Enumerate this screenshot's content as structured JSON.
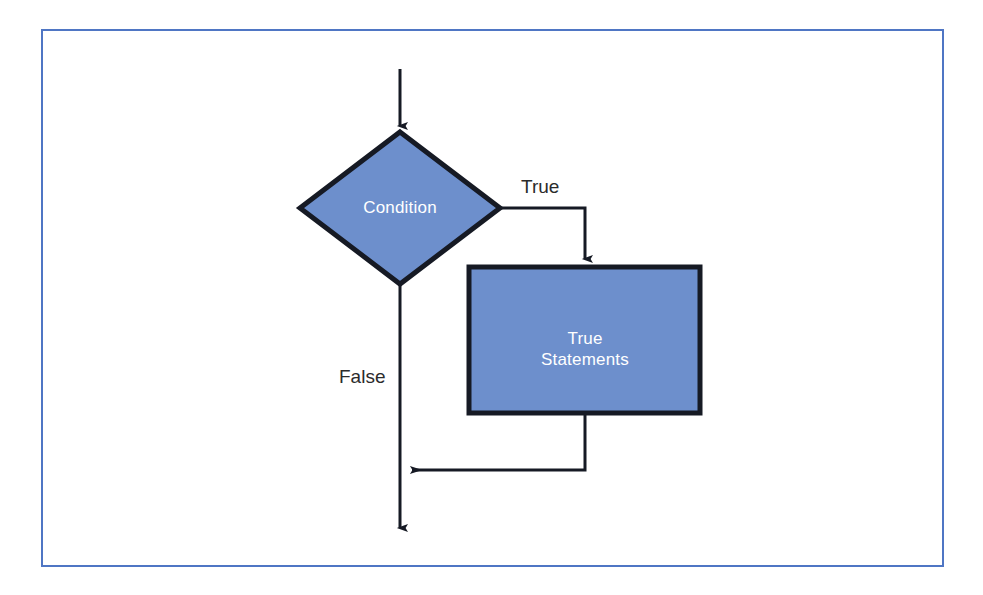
{
  "figure": {
    "kind": "flowchart",
    "frame_border_color": "#4f76c4",
    "background_color": "#ffffff"
  },
  "style": {
    "shape_fill": "#6d8fcc",
    "shape_stroke": "#161a24",
    "shape_text_color": "#ffffff",
    "connector_color": "#161a24",
    "edge_label_color": "#2b2b2b"
  },
  "nodes": {
    "condition": {
      "label": "Condition",
      "shape": "diamond"
    },
    "true_statements": {
      "label": "True\nStatements",
      "shape": "rectangle"
    }
  },
  "edges": {
    "entry": {
      "label": "",
      "from": "start",
      "to": "condition"
    },
    "true_branch": {
      "label": "True",
      "from": "condition",
      "to": "true_statements"
    },
    "false_branch": {
      "label": "False",
      "from": "condition",
      "to": "merge"
    },
    "return_branch": {
      "label": "",
      "from": "true_statements",
      "to": "merge"
    },
    "exit": {
      "label": "",
      "from": "merge",
      "to": "end"
    }
  }
}
